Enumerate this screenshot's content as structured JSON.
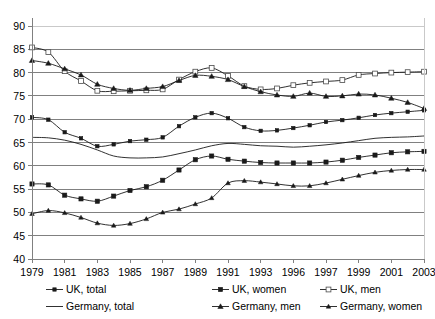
{
  "chart_data": {
    "type": "line",
    "title": "",
    "xlabel": "",
    "ylabel": "",
    "ylim": [
      40,
      90
    ],
    "ytick_step": 5,
    "yticks": [
      40,
      45,
      50,
      55,
      60,
      65,
      70,
      75,
      80,
      85,
      90
    ],
    "grid": true,
    "legend_position": "bottom",
    "x": [
      1979,
      1980,
      1981,
      1982,
      1983,
      1984,
      1985,
      1986,
      1987,
      1988,
      1989,
      1990,
      1991,
      1992,
      1993,
      1994,
      1995,
      1996,
      1997,
      1998,
      1999,
      2000,
      2001,
      2002,
      2003
    ],
    "xtick_labels": [
      "1979",
      "1981",
      "1983",
      "1985",
      "1987",
      "1989",
      "1991",
      "1993",
      "1996",
      "1997",
      "1999",
      "2001",
      "2003"
    ],
    "xtick_values": [
      1979,
      1981,
      1983,
      1985,
      1987,
      1989,
      1991,
      1993,
      1995,
      1997,
      1999,
      2001,
      2003
    ],
    "series": [
      {
        "name": "UK, total",
        "marker": "filled-square-small",
        "values": [
          70.4,
          69.9,
          67.2,
          65.9,
          64.2,
          64.6,
          65.3,
          65.6,
          66.1,
          68.5,
          70.4,
          71.3,
          70.2,
          68.3,
          67.5,
          67.6,
          68.1,
          68.7,
          69.4,
          69.8,
          70.3,
          70.9,
          71.3,
          71.6,
          71.9
        ]
      },
      {
        "name": "UK, women",
        "marker": "filled-square",
        "values": [
          56.1,
          55.9,
          53.7,
          52.9,
          52.4,
          53.5,
          54.7,
          55.5,
          56.9,
          59.1,
          61.3,
          62.1,
          61.4,
          61.0,
          60.7,
          60.6,
          60.6,
          60.6,
          60.8,
          61.2,
          61.8,
          62.3,
          62.8,
          63.0,
          63.1
        ]
      },
      {
        "name": "UK, men",
        "marker": "open-square",
        "values": [
          85.4,
          84.4,
          80.3,
          78.2,
          76.1,
          76.0,
          76.1,
          76.2,
          76.4,
          78.5,
          80.2,
          81.0,
          79.3,
          77.1,
          76.4,
          76.6,
          77.3,
          77.8,
          78.1,
          78.4,
          79.5,
          79.8,
          80.0,
          80.1,
          80.2
        ]
      },
      {
        "name": "Germany, total",
        "marker": "none",
        "values": [
          66.1,
          66.0,
          65.5,
          64.6,
          63.4,
          62.1,
          61.7,
          61.7,
          61.9,
          62.6,
          63.4,
          64.3,
          64.8,
          64.6,
          64.3,
          64.2,
          64.0,
          64.2,
          64.5,
          64.9,
          65.4,
          65.9,
          66.1,
          66.2,
          66.4
        ]
      },
      {
        "name": "Germany, men",
        "marker": "filled-triangle",
        "values": [
          82.6,
          82.0,
          80.8,
          79.5,
          77.5,
          76.6,
          76.2,
          76.6,
          77.0,
          78.3,
          79.4,
          79.2,
          78.5,
          77.0,
          75.9,
          75.2,
          74.9,
          75.6,
          74.9,
          75.0,
          75.4,
          75.2,
          74.5,
          73.6,
          72.3
        ]
      },
      {
        "name": "Germany, women",
        "marker": "filled-triangle-small",
        "values": [
          49.7,
          50.4,
          49.9,
          48.9,
          47.7,
          47.2,
          47.6,
          48.6,
          50.0,
          50.7,
          51.8,
          53.1,
          56.3,
          56.8,
          56.5,
          56.1,
          55.7,
          55.7,
          56.3,
          57.1,
          57.9,
          58.6,
          59.0,
          59.2,
          59.2
        ]
      }
    ]
  },
  "legend": {
    "items": [
      {
        "label": "UK, total",
        "marker": "filled-square-small"
      },
      {
        "label": "UK, women",
        "marker": "filled-square"
      },
      {
        "label": "UK, men",
        "marker": "open-square"
      },
      {
        "label": "Germany, total",
        "marker": "none"
      },
      {
        "label": "Germany, men",
        "marker": "filled-triangle"
      },
      {
        "label": "Germany, women",
        "marker": "filled-triangle-small"
      }
    ]
  },
  "colors": {
    "line": "#1a1a1a",
    "grid": "#808080",
    "axis": "#808080",
    "background": "#ffffff"
  }
}
